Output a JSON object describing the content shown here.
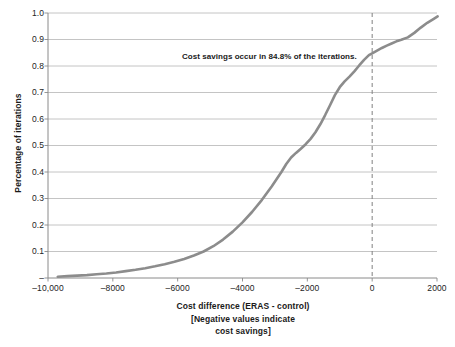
{
  "chart_data": {
    "type": "line",
    "title": "",
    "subtitle": "",
    "xlabel_lines": [
      "Cost difference (ERAS - control)",
      "[Negative values indicate",
      "cost savings]"
    ],
    "ylabel": "Percentage of iterations",
    "xlim": [
      -10000,
      2000
    ],
    "ylim": [
      0,
      1.0
    ],
    "grid": true,
    "grid_axis": "y",
    "legend": "none",
    "x_ticks": [
      -10000,
      -8000,
      -6000,
      -4000,
      -2000,
      0,
      2000
    ],
    "x_tick_labels": [
      "–10,000",
      "–8000",
      "–6000",
      "–4000",
      "–2000",
      "0",
      "2000"
    ],
    "y_ticks": [
      0,
      0.1,
      0.2,
      0.3,
      0.4,
      0.5,
      0.6,
      0.7,
      0.8,
      0.9,
      1.0
    ],
    "y_tick_labels": [
      "–",
      "0.1",
      "0.2",
      "0.3",
      "0.4",
      "0.5",
      "0.6",
      "0.7",
      "0.8",
      "0.9",
      "1.0"
    ],
    "series": [
      {
        "name": "Cumulative distribution of cost difference",
        "color": "#8c8c8c",
        "line_width": 2.6,
        "x": [
          -9700,
          -9400,
          -9100,
          -8800,
          -8500,
          -8200,
          -7900,
          -7600,
          -7300,
          -7000,
          -6700,
          -6400,
          -6100,
          -5800,
          -5500,
          -5200,
          -4900,
          -4600,
          -4300,
          -4000,
          -3700,
          -3400,
          -3100,
          -2800,
          -2650,
          -2500,
          -2350,
          -2200,
          -2050,
          -1900,
          -1750,
          -1600,
          -1450,
          -1300,
          -1150,
          -1000,
          -850,
          -700,
          -550,
          -400,
          -250,
          -100,
          0,
          150,
          300,
          450,
          600,
          750,
          900,
          1100,
          1300,
          1500,
          1700,
          1900,
          2020
        ],
        "y": [
          0.005,
          0.007,
          0.009,
          0.011,
          0.014,
          0.017,
          0.021,
          0.026,
          0.031,
          0.037,
          0.044,
          0.052,
          0.061,
          0.072,
          0.085,
          0.1,
          0.12,
          0.145,
          0.175,
          0.21,
          0.25,
          0.295,
          0.345,
          0.4,
          0.43,
          0.455,
          0.472,
          0.488,
          0.505,
          0.525,
          0.55,
          0.58,
          0.615,
          0.652,
          0.69,
          0.72,
          0.742,
          0.76,
          0.78,
          0.802,
          0.823,
          0.841,
          0.848,
          0.858,
          0.868,
          0.877,
          0.885,
          0.893,
          0.899,
          0.908,
          0.925,
          0.945,
          0.963,
          0.978,
          0.987
        ]
      }
    ],
    "reference_lines": [
      {
        "name": "zero-cost-difference",
        "orientation": "vertical",
        "value": 0,
        "style": "dashed",
        "color": "#808080"
      }
    ],
    "annotations": [
      {
        "name": "cost-savings-note",
        "text": "Cost savings occur in 84.8% of the iterations.",
        "x": -3100,
        "y": 0.855
      }
    ],
    "colors": {
      "line": "#8c8c8c",
      "grid": "#b5b5b5",
      "axis": "#8a8a8a",
      "text": "#1a1a1a",
      "background": "#ffffff"
    }
  }
}
